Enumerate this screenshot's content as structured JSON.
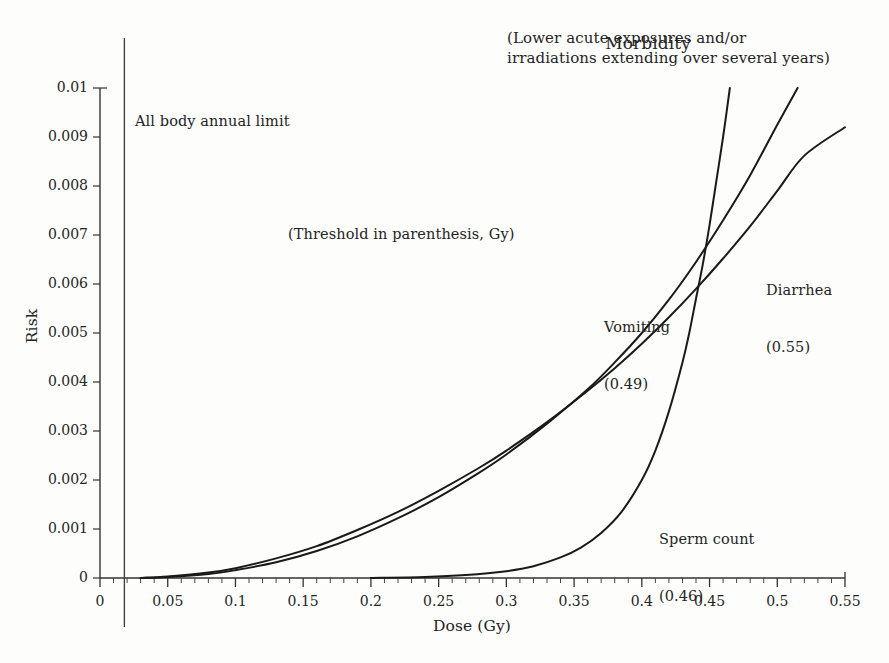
{
  "chart_data": {
    "type": "line",
    "title": "Morbidity",
    "subtitle": "(Lower acute exposures and/or irradiations extending over several years)",
    "note": "(Threshold in parenthesis, Gy)",
    "xlabel": "Dose (Gy)",
    "ylabel": "Risk",
    "xlim": [
      0,
      0.55
    ],
    "ylim": [
      0,
      0.01
    ],
    "grid": false,
    "legend_position": "inline-annotations",
    "xticks": [
      "0",
      "0.05",
      "0.1",
      "0.15",
      "0.2",
      "0.25",
      "0.3",
      "0.35",
      "0.4",
      "0.45",
      "0.5",
      "0.55"
    ],
    "xtick_values": [
      0,
      0.05,
      0.1,
      0.15,
      0.2,
      0.25,
      0.3,
      0.35,
      0.4,
      0.45,
      0.5,
      0.55
    ],
    "yticks": [
      "0",
      "0.001",
      "0.002",
      "0.003",
      "0.004",
      "0.005",
      "0.006",
      "0.007",
      "0.008",
      "0.009",
      "0.01"
    ],
    "ytick_values": [
      0,
      0.001,
      0.002,
      0.003,
      0.004,
      0.005,
      0.006,
      0.007,
      0.008,
      0.009,
      0.01
    ],
    "x_minor_tick_step": 0.01,
    "annotations": [
      {
        "name": "all-body-annual-limit",
        "label": "All body annual limit",
        "x": 0.018,
        "type": "vertical-line"
      },
      {
        "name": "threshold-note",
        "label": "(Threshold in parenthesis, Gy)",
        "x": 0.14,
        "y": 0.0072
      }
    ],
    "series": [
      {
        "name": "Sperm count",
        "threshold": 0.46,
        "label": "Sperm count",
        "sublabel": "(0.46)",
        "color": "#1a1a1a",
        "points": [
          [
            0.2,
            0.0
          ],
          [
            0.24,
            2e-05
          ],
          [
            0.27,
            6e-05
          ],
          [
            0.3,
            0.00014
          ],
          [
            0.32,
            0.00024
          ],
          [
            0.34,
            0.00042
          ],
          [
            0.355,
            0.00062
          ],
          [
            0.37,
            0.00092
          ],
          [
            0.385,
            0.00135
          ],
          [
            0.4,
            0.002
          ],
          [
            0.41,
            0.0026
          ],
          [
            0.42,
            0.0034
          ],
          [
            0.43,
            0.0044
          ],
          [
            0.435,
            0.005
          ],
          [
            0.44,
            0.0057
          ],
          [
            0.445,
            0.0064
          ],
          [
            0.45,
            0.0072
          ],
          [
            0.455,
            0.0081
          ],
          [
            0.46,
            0.009
          ],
          [
            0.465,
            0.01
          ]
        ]
      },
      {
        "name": "Vomiting",
        "threshold": 0.49,
        "label": "Vomiting",
        "sublabel": "(0.49)",
        "color": "#1a1a1a",
        "points": [
          [
            0.03,
            0.0
          ],
          [
            0.05,
            2e-05
          ],
          [
            0.08,
            8e-05
          ],
          [
            0.1,
            0.00016
          ],
          [
            0.13,
            0.00032
          ],
          [
            0.16,
            0.00055
          ],
          [
            0.19,
            0.00085
          ],
          [
            0.22,
            0.00122
          ],
          [
            0.25,
            0.00165
          ],
          [
            0.28,
            0.00215
          ],
          [
            0.3,
            0.00252
          ],
          [
            0.33,
            0.00315
          ],
          [
            0.36,
            0.00385
          ],
          [
            0.38,
            0.0044
          ],
          [
            0.4,
            0.005
          ],
          [
            0.42,
            0.00568
          ],
          [
            0.44,
            0.00645
          ],
          [
            0.46,
            0.0073
          ],
          [
            0.48,
            0.00822
          ],
          [
            0.5,
            0.00925
          ],
          [
            0.515,
            0.01
          ]
        ]
      },
      {
        "name": "Diarrhea",
        "threshold": 0.55,
        "label": "Diarrhea",
        "sublabel": "(0.55)",
        "color": "#1a1a1a",
        "points": [
          [
            0.03,
            0.0
          ],
          [
            0.05,
            3e-05
          ],
          [
            0.08,
            0.00011
          ],
          [
            0.1,
            0.0002
          ],
          [
            0.13,
            0.0004
          ],
          [
            0.16,
            0.00065
          ],
          [
            0.19,
            0.00098
          ],
          [
            0.22,
            0.00135
          ],
          [
            0.25,
            0.00178
          ],
          [
            0.28,
            0.00225
          ],
          [
            0.3,
            0.0026
          ],
          [
            0.33,
            0.00318
          ],
          [
            0.36,
            0.00382
          ],
          [
            0.38,
            0.00428
          ],
          [
            0.4,
            0.00478
          ],
          [
            0.42,
            0.00532
          ],
          [
            0.44,
            0.0059
          ],
          [
            0.46,
            0.00652
          ],
          [
            0.48,
            0.00718
          ],
          [
            0.5,
            0.0079
          ],
          [
            0.52,
            0.00862
          ],
          [
            0.55,
            0.0092
          ]
        ]
      }
    ]
  }
}
